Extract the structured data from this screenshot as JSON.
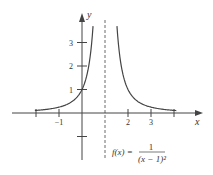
{
  "chart_data": {
    "type": "line",
    "title": "",
    "function": "f(x) = 1/(x-1)^2",
    "annotation": {
      "lhs": "f(x) =",
      "numerator": "1",
      "denominator": "(x − 1)²"
    },
    "xlabel": "x",
    "ylabel": "y",
    "xlim": [
      -2.5,
      4.5
    ],
    "ylim": [
      -1.5,
      3.9
    ],
    "x_ticks": [
      -2,
      -1,
      1,
      2,
      3,
      4
    ],
    "x_tick_labels": [
      {
        "v": -1,
        "t": "−1"
      },
      {
        "v": 2,
        "t": "2"
      },
      {
        "v": 3,
        "t": "3"
      }
    ],
    "y_ticks": [
      -1,
      1,
      2,
      3
    ],
    "y_tick_labels": [
      {
        "v": 1,
        "t": "1"
      },
      {
        "v": 2,
        "t": "2"
      },
      {
        "v": 3,
        "t": "3"
      }
    ],
    "asymptote": {
      "type": "vertical",
      "x": 1,
      "style": "dashed"
    },
    "grid": false,
    "series": [
      {
        "name": "f(x) left branch",
        "x": [
          -2.5,
          -2,
          -1,
          -0.5,
          0,
          0.25,
          0.4,
          0.48
        ],
        "y": [
          0.082,
          0.111,
          0.25,
          0.444,
          1,
          1.778,
          2.778,
          3.7
        ]
      },
      {
        "name": "f(x) right branch",
        "x": [
          1.52,
          1.6,
          1.75,
          2,
          2.5,
          3,
          4,
          4.5
        ],
        "y": [
          3.7,
          2.778,
          1.778,
          1,
          0.444,
          0.25,
          0.111,
          0.082
        ]
      }
    ],
    "color": "#444444"
  }
}
